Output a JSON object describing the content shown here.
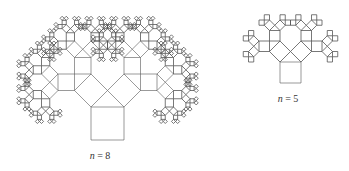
{
  "figure": {
    "type": "Pythagoras tree fractal",
    "stroke_color": "#555555",
    "trees": [
      {
        "id": "tree-n8",
        "levels": 8,
        "base": {
          "x": 91,
          "y": 107,
          "side": 33
        },
        "label": {
          "var": "n",
          "eq": " = ",
          "value": "8",
          "x": 100,
          "y": 150
        }
      },
      {
        "id": "tree-n5",
        "levels": 5,
        "base": {
          "x": 280,
          "y": 62,
          "side": 21
        },
        "label": {
          "var": "n",
          "eq": " = ",
          "value": "5",
          "x": 288,
          "y": 93
        }
      }
    ]
  }
}
